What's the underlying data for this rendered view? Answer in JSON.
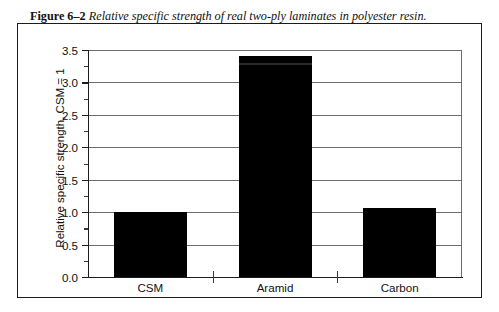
{
  "caption": {
    "label": "Figure 6–2",
    "text": "Relative specific strength of real two-ply laminates in polyester resin."
  },
  "chart_data": {
    "type": "bar",
    "title": "",
    "xlabel": "",
    "ylabel": "Relative specific strength, CSM = 1",
    "categories": [
      "CSM",
      "Aramid",
      "Carbon"
    ],
    "values": [
      1.0,
      3.4,
      1.07
    ],
    "series": [
      {
        "name": "Relative specific strength",
        "values": [
          1.0,
          3.4,
          1.07
        ]
      }
    ],
    "ylim": [
      0.0,
      3.5
    ],
    "ytick_labels": [
      "0.0",
      "0.5",
      "1.0",
      "1.5",
      "2.0",
      "2.5",
      "3.0",
      "3.5"
    ],
    "ytick_values": [
      0.0,
      0.5,
      1.0,
      1.5,
      2.0,
      2.5,
      3.0,
      3.5
    ],
    "yminor_values": [
      0.25,
      0.75,
      1.25,
      1.75,
      2.25,
      2.75,
      3.25
    ],
    "grid": true,
    "grid_axis": "y",
    "legend": false,
    "legend_position": "none",
    "bar_color": "#000000"
  }
}
